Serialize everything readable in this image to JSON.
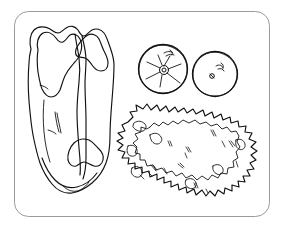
{
  "image": {
    "title": "Plate with steak, tomato slices and lettuce",
    "style": "black and white line drawing",
    "background_color": "#ffffff",
    "ink_color": "#111111",
    "plate_border_color": "#9a9a9a",
    "width": 283,
    "height": 229
  },
  "objects": {
    "plate": {
      "name": "plate",
      "shape": "rounded-rectangle",
      "corner_radius": 14,
      "x": 14,
      "y": 11,
      "width": 256,
      "height": 206
    },
    "steak": {
      "name": "t-bone-steak",
      "label": "steak",
      "position": "left",
      "x": 24,
      "y": 25,
      "width": 92,
      "height": 170
    },
    "tomato_slice_left": {
      "name": "tomato-slice-with-core",
      "label": "tomato slice",
      "center_x": 163,
      "center_y": 69,
      "radius": 25,
      "detail": "radial core star"
    },
    "tomato_slice_right": {
      "name": "tomato-slice-with-seeds",
      "label": "tomato slice",
      "center_x": 215,
      "center_y": 74,
      "radius": 23,
      "detail": "two small seeds"
    },
    "lettuce": {
      "name": "lettuce-leaf-pile",
      "label": "lettuce",
      "position": "bottom-right",
      "x": 122,
      "y": 104,
      "width": 136,
      "height": 100,
      "detail": "ruffled jagged edge with interior dashes"
    }
  },
  "icons": {
    "plate_icon": "plate-icon",
    "steak_icon": "steak-icon",
    "tomato_icon": "tomato-icon",
    "lettuce_icon": "lettuce-icon"
  }
}
